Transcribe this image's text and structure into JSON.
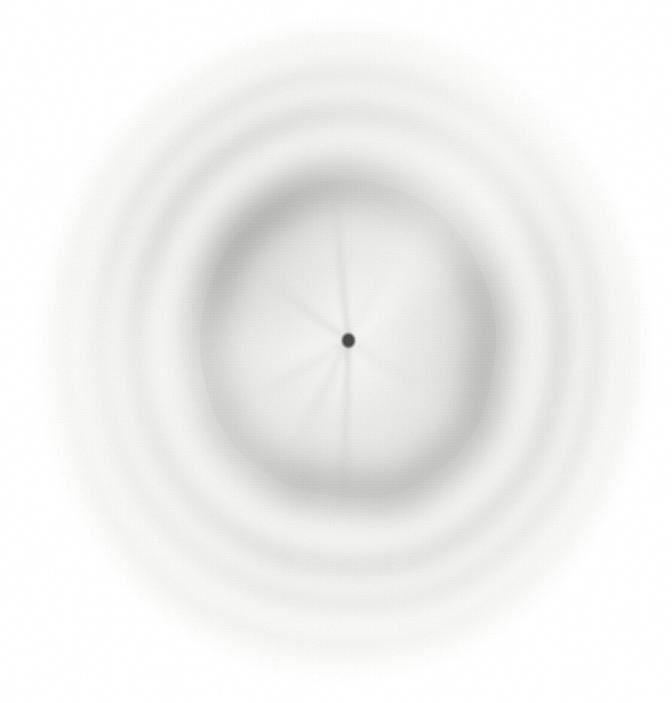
{
  "image": {
    "kind": "scanned-photographic-plate",
    "subject": "x-ray-powder-diffraction-pattern",
    "width": 672,
    "height": 703,
    "background_color": "#ffffff",
    "plate_base_color": "#fbfbfa",
    "grain": "halftone-screen",
    "notes_visible_text": ""
  },
  "chart_data": {
    "type": "heatmap",
    "title": "",
    "subtitle": "",
    "xlabel": "",
    "ylabel": "",
    "projection": "polar",
    "center": {
      "x": 348,
      "y": 340
    },
    "ellipticity": {
      "rx_scale": 1.0,
      "ry_scale": 1.06
    },
    "exposed_field": {
      "name": "film-exposed-disc",
      "center_x": 342,
      "center_y": 350,
      "radius_x": 312,
      "radius_y": 336,
      "edge_softness": 38,
      "tint": "#f6f6f4"
    },
    "beam_stop": {
      "name": "central-beam-stop",
      "x": 348,
      "y": 340,
      "radius": 7,
      "color": "#4a4a4a"
    },
    "radial_streaks": [
      {
        "angle_deg": 92,
        "length": 170,
        "width": 5,
        "opacity": 0.16
      },
      {
        "angle_deg": 118,
        "length": 120,
        "width": 6,
        "opacity": 0.1
      },
      {
        "angle_deg": 150,
        "length": 110,
        "width": 7,
        "opacity": 0.09
      },
      {
        "angle_deg": 214,
        "length": 115,
        "width": 6,
        "opacity": 0.1
      },
      {
        "angle_deg": 264,
        "length": 150,
        "width": 5,
        "opacity": 0.14
      },
      {
        "angle_deg": 300,
        "length": 100,
        "width": 8,
        "opacity": 0.07
      },
      {
        "angle_deg": 32,
        "length": 95,
        "width": 8,
        "opacity": 0.06
      }
    ],
    "rings": [
      {
        "id": "inner-diffuse-halo-core",
        "label": "amorphous inner halo (diffuse)",
        "radius": 96,
        "width": 70,
        "intensity": 0.13,
        "color": "#9a9a9a",
        "roughness": 0.04
      },
      {
        "id": "inner-diffuse-halo-rim",
        "label": "inner halo dark rim",
        "radius": 144,
        "width": 34,
        "intensity": 0.34,
        "color": "#7e7e7e",
        "roughness": 0.1
      },
      {
        "id": "ring-2",
        "label": "first sharp Debye ring",
        "radius": 214,
        "width": 20,
        "intensity": 0.2,
        "color": "#9d9d9d",
        "roughness": 0.03
      },
      {
        "id": "ring-3",
        "label": "second Debye ring",
        "radius": 250,
        "width": 17,
        "intensity": 0.14,
        "color": "#adadad",
        "roughness": 0.03
      },
      {
        "id": "ring-4",
        "label": "third Debye ring (faint)",
        "radius": 290,
        "width": 16,
        "intensity": 0.07,
        "color": "#bcbcbc",
        "roughness": 0.02
      },
      {
        "id": "ring-5",
        "label": "outer halo edge (very faint)",
        "radius": 318,
        "width": 22,
        "intensity": 0.04,
        "color": "#c8c8c8",
        "roughness": 0.02
      }
    ],
    "legend": [],
    "annotations": []
  }
}
